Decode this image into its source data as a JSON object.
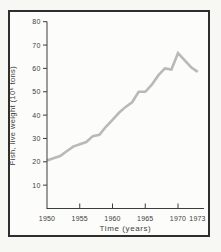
{
  "figure": {
    "background_color": "#f7f7f4",
    "frame_color": "#2e2e2e",
    "plot_background_color": "#fcfcfa"
  },
  "chart_data": {
    "type": "line",
    "title": "",
    "xlabel": "Time (years)",
    "ylabel": "Fish, live weight (10⁶ tons)",
    "x": [
      1950,
      1951,
      1952,
      1953,
      1954,
      1955,
      1956,
      1957,
      1958,
      1959,
      1960,
      1961,
      1962,
      1963,
      1964,
      1965,
      1966,
      1967,
      1968,
      1969,
      1970,
      1971,
      1972,
      1973
    ],
    "values": [
      20.5,
      21.5,
      22.5,
      24.5,
      26.5,
      27.5,
      28.5,
      31,
      31.5,
      35,
      38,
      41,
      43.5,
      45.5,
      50,
      50,
      53,
      57,
      60,
      59.5,
      66.5,
      63.5,
      60.5,
      58.5
    ],
    "x_tick_labels": [
      1950,
      1955,
      1960,
      1965,
      1970,
      1973
    ],
    "x_ticks_with_marks": [
      1955,
      1960,
      1965,
      1970
    ],
    "y_ticks": [
      10,
      20,
      30,
      40,
      50,
      60,
      70,
      80
    ],
    "xlim": [
      1950,
      1973
    ],
    "ylim": [
      0,
      80
    ],
    "grid": false,
    "legend": null,
    "line_color": "#b9b9b9",
    "axis_color": "#3c3c3c"
  }
}
